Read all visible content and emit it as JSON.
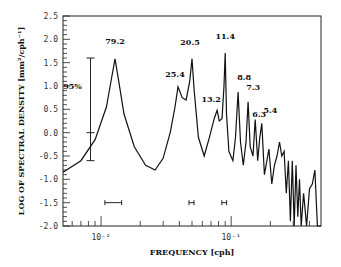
{
  "chart_data": {
    "type": "line",
    "title": "",
    "xlabel": "FREQUENCY [cph]",
    "ylabel": "LOG OF SPECTRAL DENSITY [mm²/cph⁻¹]",
    "xscale": "log",
    "xlim": [
      0.0051,
      0.49
    ],
    "ylim": [
      -2.0,
      2.5
    ],
    "x_tick_labels": [
      "10⁻²",
      "10⁻¹"
    ],
    "y_tick_labels": [
      "2.5",
      "2.0",
      "1.5",
      "1.0",
      "0.5",
      "0.0",
      "-0.5",
      "-1.0",
      "-1.5",
      "-2.0"
    ],
    "confidence_interval": {
      "label": "95%",
      "center": 0.0,
      "upper": 1.6,
      "lower": -0.6,
      "x": 0.0083
    },
    "bandwidth_bars": [
      {
        "x_from": 0.0107,
        "x_to": 0.0144,
        "y": -1.5
      },
      {
        "x_from": 0.0474,
        "x_to": 0.0518,
        "y": -1.5
      },
      {
        "x_from": 0.0847,
        "x_to": 0.0922,
        "y": -1.5
      }
    ],
    "peak_annotations": [
      {
        "label": "79.2",
        "freq": 0.0128,
        "value": 1.58
      },
      {
        "label": "25.4",
        "freq": 0.039,
        "value": 0.98
      },
      {
        "label": "20.5",
        "freq": 0.05,
        "value": 1.58
      },
      {
        "label": "13.2",
        "freq": 0.078,
        "value": 0.48
      },
      {
        "label": "11.4",
        "freq": 0.09,
        "value": 1.71
      },
      {
        "label": "8.8",
        "freq": 0.113,
        "value": 0.87
      },
      {
        "label": "7.3",
        "freq": 0.135,
        "value": 0.66
      },
      {
        "label": "6.3",
        "freq": 0.153,
        "value": 0.28
      },
      {
        "label": "5.4",
        "freq": 0.18,
        "value": 0.2
      }
    ],
    "series": [
      {
        "name": "spectrum",
        "x": [
          0.0051,
          0.007,
          0.009,
          0.011,
          0.012,
          0.0128,
          0.0135,
          0.015,
          0.018,
          0.022,
          0.026,
          0.03,
          0.034,
          0.037,
          0.039,
          0.042,
          0.045,
          0.048,
          0.05,
          0.052,
          0.056,
          0.062,
          0.068,
          0.074,
          0.078,
          0.081,
          0.085,
          0.088,
          0.09,
          0.092,
          0.096,
          0.103,
          0.108,
          0.113,
          0.118,
          0.124,
          0.13,
          0.135,
          0.14,
          0.147,
          0.153,
          0.16,
          0.166,
          0.172,
          0.18,
          0.188,
          0.195,
          0.205,
          0.215,
          0.225,
          0.235,
          0.245,
          0.255,
          0.265,
          0.275,
          0.285,
          0.295,
          0.305,
          0.315,
          0.325,
          0.335,
          0.345,
          0.36,
          0.38,
          0.4,
          0.42,
          0.44,
          0.46,
          0.475,
          0.49
        ],
        "y": [
          -0.85,
          -0.6,
          -0.15,
          0.55,
          1.15,
          1.58,
          1.2,
          0.4,
          -0.3,
          -0.7,
          -0.8,
          -0.55,
          0.0,
          0.55,
          0.98,
          0.75,
          0.7,
          1.1,
          1.58,
          0.9,
          -0.1,
          -0.5,
          -0.1,
          0.3,
          0.48,
          0.25,
          0.3,
          1.0,
          1.71,
          0.4,
          -0.4,
          -0.6,
          -0.1,
          0.87,
          -0.2,
          -0.7,
          -0.2,
          0.66,
          -0.3,
          -0.5,
          0.28,
          -0.6,
          -0.1,
          0.2,
          -0.9,
          -0.6,
          -0.35,
          -1.1,
          -0.7,
          -0.5,
          -0.2,
          -0.5,
          -0.4,
          -1.3,
          -0.6,
          -1.9,
          -0.6,
          -2.0,
          -0.7,
          -1.8,
          -1.0,
          -2.0,
          -1.3,
          -2.0,
          -1.2,
          -1.1,
          -0.8,
          -2.0,
          -2.0,
          -2.0
        ]
      }
    ]
  }
}
